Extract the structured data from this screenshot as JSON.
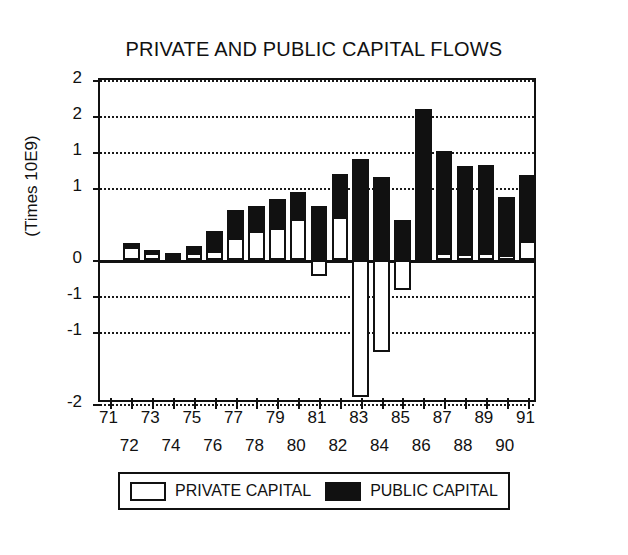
{
  "chart_data": {
    "type": "bar",
    "title": "PRIVATE AND PUBLIC CAPITAL FLOWS",
    "xlabel": "",
    "ylabel": "(Times 10E9)",
    "stacked": true,
    "grid": true,
    "legend_position": "bottom",
    "ylim": [
      -2.0,
      2.5
    ],
    "ytick_values": [
      2.5,
      2.0,
      1.5,
      1.0,
      0.0,
      -0.5,
      -1.0,
      -2.0
    ],
    "ytick_labels": [
      "2",
      "2",
      "1",
      "1",
      "0",
      "-1",
      "-1",
      "-2"
    ],
    "categories": [
      "71",
      "72",
      "73",
      "74",
      "75",
      "76",
      "77",
      "78",
      "79",
      "80",
      "81",
      "82",
      "83",
      "84",
      "85",
      "86",
      "87",
      "88",
      "89",
      "90",
      "91"
    ],
    "series": [
      {
        "name": "PRIVATE CAPITAL",
        "color": "#ffffff",
        "values": [
          0.0,
          0.18,
          0.1,
          0.06,
          0.1,
          0.12,
          0.3,
          0.4,
          0.45,
          0.57,
          -0.22,
          0.6,
          -1.9,
          -1.28,
          -0.42,
          0.05,
          0.1,
          0.08,
          0.1,
          0.07,
          0.26
        ]
      },
      {
        "name": "PUBLIC CAPITAL",
        "color": "#111111",
        "values": [
          0.0,
          0.06,
          0.04,
          0.04,
          0.1,
          0.28,
          0.4,
          0.35,
          0.4,
          0.38,
          0.75,
          0.6,
          1.4,
          1.15,
          0.55,
          2.05,
          1.42,
          1.22,
          1.22,
          0.8,
          0.92
        ]
      }
    ],
    "totals": [
      0.0,
      0.24,
      0.14,
      0.1,
      0.2,
      0.4,
      0.7,
      0.75,
      0.85,
      0.95,
      0.53,
      1.2,
      -0.5,
      -0.13,
      0.13,
      2.1,
      1.52,
      1.3,
      1.32,
      0.87,
      1.18
    ]
  },
  "legend": {
    "entries": [
      {
        "label": "PRIVATE CAPITAL",
        "swatch": "white-box-swatch"
      },
      {
        "label": "PUBLIC CAPITAL",
        "swatch": "black-box-swatch"
      }
    ]
  },
  "colors": {
    "private": "#ffffff",
    "public": "#111111",
    "axis": "#111111",
    "background": "#ffffff"
  }
}
